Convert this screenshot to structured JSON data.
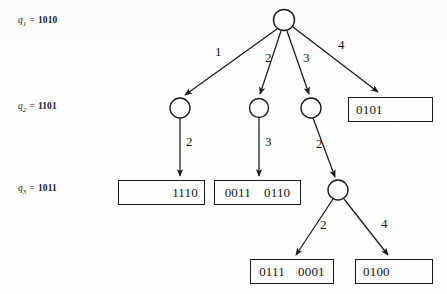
{
  "figure": {
    "stroke_color": "#1a1a1a",
    "background_color": "#fdfdfd"
  },
  "state_labels": [
    {
      "name": "q",
      "subscript": "1",
      "equals": "=",
      "value": "1010",
      "x": 18,
      "y": 20
    },
    {
      "name": "q",
      "subscript": "2",
      "equals": "=",
      "value": "1101",
      "x": 18,
      "y": 106
    },
    {
      "name": "q",
      "subscript": "3",
      "equals": "=",
      "value": "1011",
      "x": 18,
      "y": 188
    }
  ],
  "nodes": [
    {
      "id": "root",
      "cx": 284,
      "cy": 20,
      "r": 10.5
    },
    {
      "id": "n1",
      "cx": 180,
      "cy": 108,
      "r": 10
    },
    {
      "id": "n2",
      "cx": 259,
      "cy": 108,
      "r": 9.5
    },
    {
      "id": "n3",
      "cx": 311,
      "cy": 108,
      "r": 10
    },
    {
      "id": "n4",
      "cx": 338,
      "cy": 190,
      "r": 10
    }
  ],
  "edges": [
    {
      "from": "root",
      "to": "n1",
      "label": "1",
      "label_x": 215,
      "label_y": 51
    },
    {
      "from": "root",
      "to": "n2",
      "label": "2",
      "label_x": 265,
      "label_y": 57
    },
    {
      "from": "root",
      "to": "n3",
      "label": "3",
      "label_x": 303,
      "label_y": 57
    },
    {
      "from": "root",
      "to": "box1",
      "label": "4",
      "label_x": 338,
      "label_y": 44
    },
    {
      "from": "n1",
      "to": "box2",
      "label": "2",
      "label_x": 186,
      "label_y": 141
    },
    {
      "from": "n2",
      "to": "box3",
      "label": "3",
      "label_x": 265,
      "label_y": 141
    },
    {
      "from": "n3",
      "to": "n4",
      "label": "2",
      "label_x": 316,
      "label_y": 143
    },
    {
      "from": "n4",
      "to": "box4",
      "label": "2",
      "label_x": 320,
      "label_y": 224
    },
    {
      "from": "n4",
      "to": "box5",
      "label": "4",
      "label_x": 381,
      "label_y": 223
    }
  ],
  "boxes": [
    {
      "id": "box1",
      "values": [
        "0101"
      ],
      "align": "left",
      "x": 348,
      "y": 97,
      "w": 85,
      "h": 25
    },
    {
      "id": "box2",
      "values": [
        "1110"
      ],
      "align": "right",
      "x": 118,
      "y": 180,
      "w": 87,
      "h": 25
    },
    {
      "id": "box3",
      "values": [
        "0011",
        "0110"
      ],
      "align": "center",
      "x": 214,
      "y": 180,
      "w": 87,
      "h": 25
    },
    {
      "id": "box4",
      "values": [
        "0111",
        "0001"
      ],
      "align": "center",
      "x": 250,
      "y": 259,
      "w": 84,
      "h": 25
    },
    {
      "id": "box5",
      "values": [
        "0100"
      ],
      "align": "left",
      "x": 355,
      "y": 259,
      "w": 78,
      "h": 25
    }
  ]
}
